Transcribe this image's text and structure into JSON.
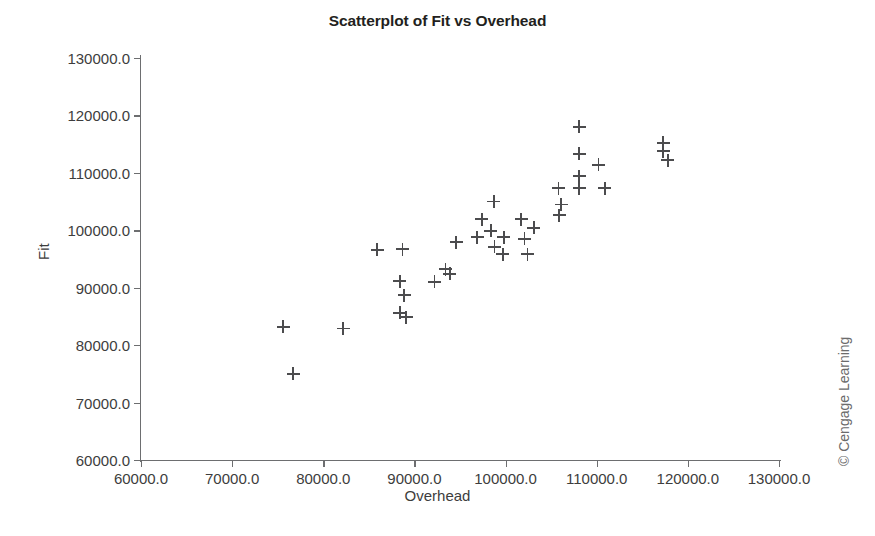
{
  "chart_data": {
    "type": "scatter",
    "title": "Scatterplot of Fit vs Overhead",
    "xlabel": "Overhead",
    "ylabel": "Fit",
    "xlim": [
      60000,
      130000
    ],
    "ylim": [
      60000,
      130000
    ],
    "xticks": [
      60000,
      70000,
      80000,
      90000,
      100000,
      110000,
      120000,
      130000
    ],
    "yticks": [
      60000,
      70000,
      80000,
      90000,
      100000,
      110000,
      120000,
      130000
    ],
    "xtick_labels": [
      "60000.0",
      "70000.0",
      "80000.0",
      "90000.0",
      "100000.0",
      "110000.0",
      "120000.0",
      "130000.0"
    ],
    "ytick_labels": [
      "60000.0",
      "70000.0",
      "80000.0",
      "90000.0",
      "100000.0",
      "110000.0",
      "120000.0",
      "130000.0"
    ],
    "grid": false,
    "legend": false,
    "marker": "plus",
    "marker_color": "#4c4c4e",
    "points": [
      {
        "x": 75600,
        "y": 83200
      },
      {
        "x": 76700,
        "y": 75000
      },
      {
        "x": 82200,
        "y": 82900
      },
      {
        "x": 85900,
        "y": 96600
      },
      {
        "x": 88700,
        "y": 96700
      },
      {
        "x": 88400,
        "y": 91100
      },
      {
        "x": 88900,
        "y": 88700
      },
      {
        "x": 88400,
        "y": 85600
      },
      {
        "x": 89100,
        "y": 84900
      },
      {
        "x": 92200,
        "y": 91000
      },
      {
        "x": 93900,
        "y": 92400
      },
      {
        "x": 93400,
        "y": 93200
      },
      {
        "x": 94600,
        "y": 97900
      },
      {
        "x": 98700,
        "y": 105000
      },
      {
        "x": 97400,
        "y": 101900
      },
      {
        "x": 101700,
        "y": 101900
      },
      {
        "x": 98400,
        "y": 99900
      },
      {
        "x": 96900,
        "y": 98800
      },
      {
        "x": 99800,
        "y": 98800
      },
      {
        "x": 102100,
        "y": 98500
      },
      {
        "x": 98800,
        "y": 97100
      },
      {
        "x": 99700,
        "y": 95800
      },
      {
        "x": 102400,
        "y": 95800
      },
      {
        "x": 108100,
        "y": 118000
      },
      {
        "x": 117300,
        "y": 115200
      },
      {
        "x": 117300,
        "y": 113800
      },
      {
        "x": 117800,
        "y": 112200
      },
      {
        "x": 108100,
        "y": 113300
      },
      {
        "x": 110200,
        "y": 111400
      },
      {
        "x": 108100,
        "y": 109400
      },
      {
        "x": 105800,
        "y": 107300
      },
      {
        "x": 108100,
        "y": 107300
      },
      {
        "x": 110900,
        "y": 107300
      },
      {
        "x": 106100,
        "y": 104500
      },
      {
        "x": 105900,
        "y": 102600
      },
      {
        "x": 103100,
        "y": 100400
      }
    ]
  },
  "credit": "© Cengage Learning"
}
